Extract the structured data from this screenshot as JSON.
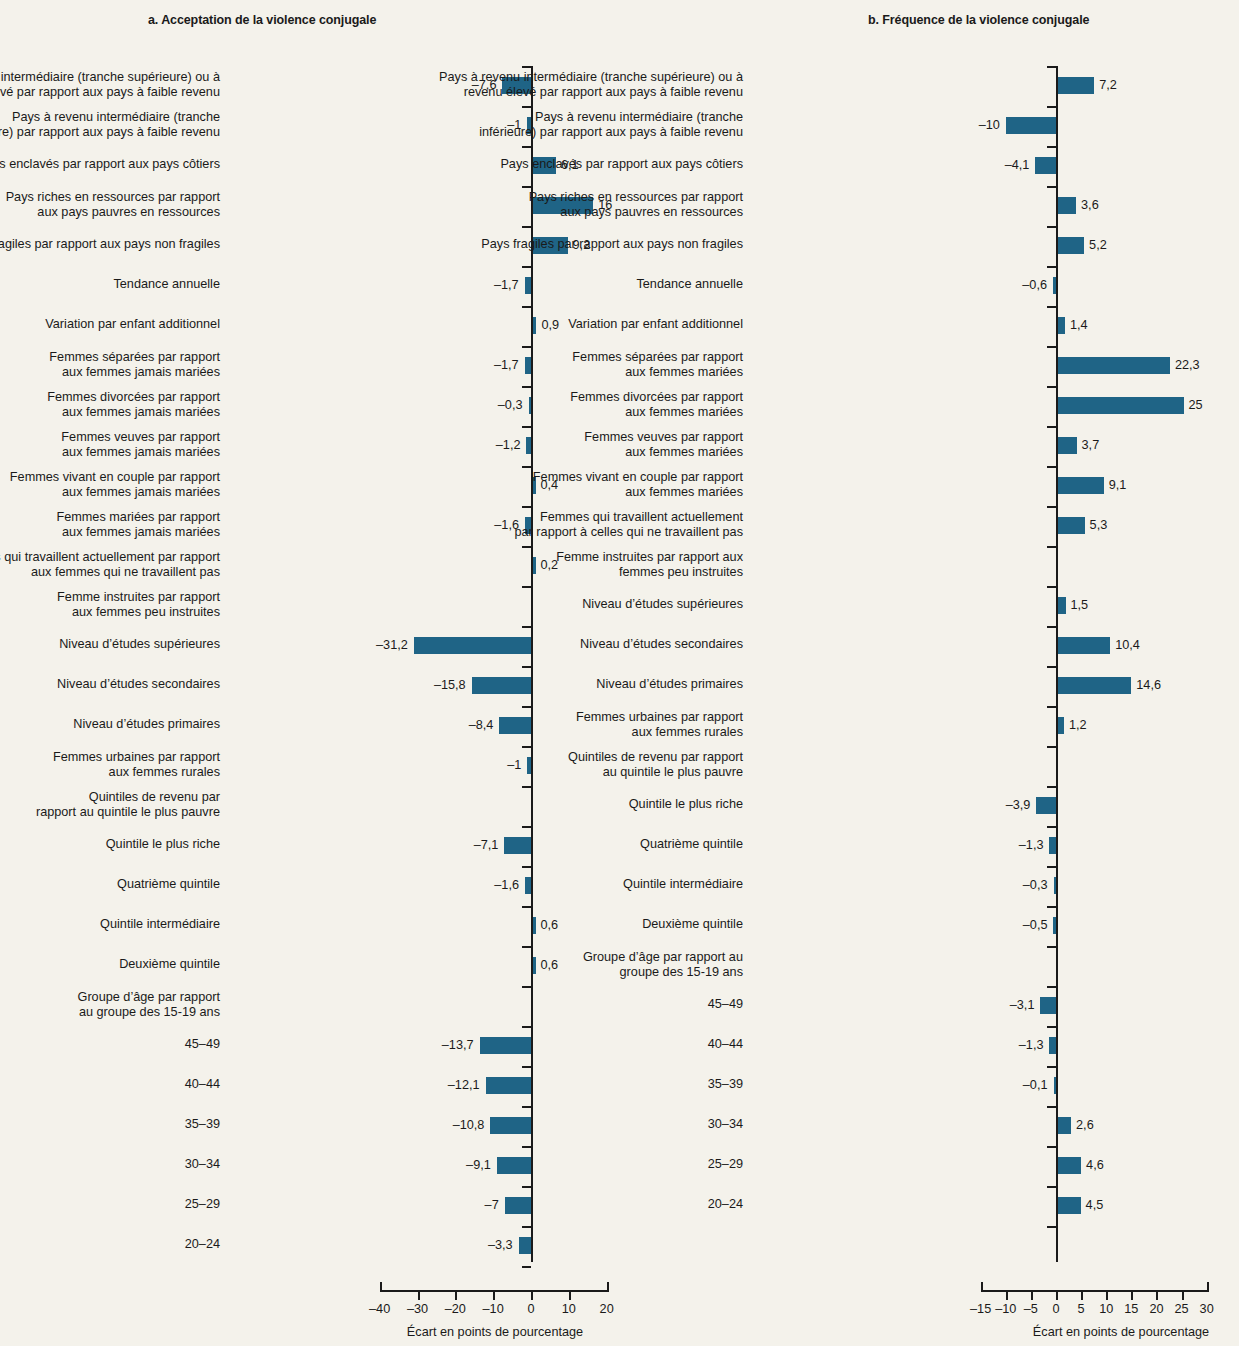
{
  "figure": {
    "background_color": "#f4f2eb",
    "bar_color": "#1f6486",
    "text_color": "#1a1a1a"
  },
  "panel_a": {
    "title": "a. Acceptation de la violence conjugale",
    "axis_caption": "Écart en points de pourcentage"
  },
  "panel_b": {
    "title": "b. Fréquence de la violence conjugale",
    "axis_caption": "Écart en points de pourcentage"
  },
  "chart_data": [
    {
      "type": "bar",
      "orientation": "horizontal",
      "title": "a. Acceptation de la violence conjugale",
      "xlabel": "Écart en points de pourcentage",
      "ylabel": "",
      "xlim": [
        -40,
        20
      ],
      "xticks": [
        -40,
        -30,
        -20,
        -10,
        0,
        10,
        20
      ],
      "xticklabels": [
        "–40",
        "–30",
        "–20",
        "–10",
        "0",
        "10",
        "20"
      ],
      "grid": false,
      "legend": null,
      "categories": [
        "Pays à revenu intermédiaire (tranche supérieure) ou à\nrevenu élevé par rapport aux pays à faible revenu",
        "Pays à revenu intermédiaire (tranche\ninférieure) par rapport aux pays à faible revenu",
        "Pays enclavés par rapport aux pays côtiers",
        "Pays riches en ressources par rapport\naux pays pauvres en ressources",
        "Pays fragiles par rapport aux pays non fragiles",
        "Tendance annuelle",
        "Variation par enfant additionnel",
        "Femmes séparées par rapport\naux femmes jamais mariées",
        "Femmes divorcées par rapport\naux femmes jamais mariées",
        "Femmes veuves par rapport\naux femmes jamais mariées",
        "Femmes vivant en couple par rapport\naux femmes jamais mariées",
        "Femmes mariées par rapport\naux femmes jamais mariées",
        "Femmes qui travaillent actuellement par rapport\naux femmes qui ne travaillent pas",
        "Femme instruites par rapport\naux femmes peu instruites",
        "Niveau d’études supérieures",
        "Niveau d’études secondaires",
        "Niveau d’études primaires",
        "Femmes urbaines par rapport\naux femmes rurales",
        "Quintiles de revenu par\nrapport au quintile le plus pauvre",
        "Quintile le plus riche",
        "Quatrième quintile",
        "Quintile intermédiaire",
        "Deuxième quintile",
        "Groupe d’âge par rapport\nau groupe des 15-19 ans",
        "45–49",
        "40–44",
        "35–39",
        "30–34",
        "25–29",
        "20–24"
      ],
      "values": [
        -7.6,
        -1,
        6.1,
        16,
        9.2,
        -1.7,
        0.9,
        -1.7,
        -0.3,
        -1.2,
        0.4,
        -1.6,
        0.2,
        null,
        -31.2,
        -15.8,
        -8.4,
        -1,
        null,
        -7.1,
        -1.6,
        0.6,
        0.6,
        null,
        -13.7,
        -12.1,
        -10.8,
        -9.1,
        -7,
        -3.3
      ],
      "value_labels": [
        "–7,6",
        "–1",
        "6,1",
        "16",
        "9,2",
        "–1,7",
        "0,9",
        "–1,7",
        "–0,3",
        "–1,2",
        "0,4",
        "–1,6",
        "0,2",
        "",
        "–31,2",
        "–15,8",
        "–8,4",
        "–1",
        "",
        "–7,1",
        "–1,6",
        "0,6",
        "0,6",
        "",
        "–13,7",
        "–12,1",
        "–10,8",
        "–9,1",
        "–7",
        "–3,3"
      ]
    },
    {
      "type": "bar",
      "orientation": "horizontal",
      "title": "b. Fréquence de la violence conjugale",
      "xlabel": "Écart en points de pourcentage",
      "ylabel": "",
      "xlim": [
        -15,
        30
      ],
      "xticks": [
        -15,
        -10,
        -5,
        0,
        5,
        10,
        15,
        20,
        25,
        30
      ],
      "xticklabels": [
        "–15",
        "–10",
        "–5",
        "0",
        "5",
        "10",
        "15",
        "20",
        "25",
        "30"
      ],
      "grid": false,
      "legend": null,
      "categories": [
        "Pays à revenu intermédiaire (tranche supérieure) ou à\nrevenu élevé par rapport aux pays à faible revenu",
        "Pays à revenu intermédiaire (tranche\ninférieure) par rapport aux pays à faible revenu",
        "Pays enclavés par rapport aux pays côtiers",
        "Pays riches en ressources par rapport\naux pays pauvres en ressources",
        "Pays fragiles par rapport aux pays non fragiles",
        "Tendance annuelle",
        "Variation par enfant additionnel",
        "Femmes séparées par rapport\naux femmes  mariées",
        "Femmes divorcées par rapport\naux femmes mariées",
        "Femmes veuves par rapport\naux femmes  mariées",
        "Femmes vivant en couple par rapport\naux femmes mariées",
        "Femmes qui travaillent actuellement\npar rapport à celles qui ne travaillent pas",
        "Femme instruites par rapport aux\nfemmes peu instruites",
        "Niveau d’études supérieures",
        "Niveau d’études secondaires",
        "Niveau d’études primaires",
        "Femmes urbaines par rapport\naux femmes rurales",
        "Quintiles de revenu par rapport\nau quintile le plus pauvre",
        "Quintile le plus riche",
        "Quatrième quintile",
        "Quintile intermédiaire",
        "Deuxième quintile",
        "Groupe d’âge par rapport au\ngroupe des 15-19 ans",
        "45–49",
        "40–44",
        "35–39",
        "30–34",
        "25–29",
        "20–24"
      ],
      "values": [
        7.2,
        -10,
        -4.1,
        3.6,
        5.2,
        -0.6,
        1.4,
        22.3,
        25,
        3.7,
        9.1,
        5.3,
        null,
        1.5,
        10.4,
        14.6,
        1.2,
        null,
        -3.9,
        -1.3,
        -0.3,
        -0.5,
        null,
        -3.1,
        -1.3,
        -0.1,
        2.6,
        4.6,
        4.5
      ],
      "value_labels": [
        "7,2",
        "–10",
        "–4,1",
        "3,6",
        "5,2",
        "–0,6",
        "1,4",
        "22,3",
        "25",
        "3,7",
        "9,1",
        "5,3",
        "",
        "1,5",
        "10,4",
        "14,6",
        "1,2",
        "",
        "–3,9",
        "–1,3",
        "–0,3",
        "–0,5",
        "",
        "–3,1",
        "–1,3",
        "–0,1",
        "2,6",
        "4,6",
        "4,5"
      ]
    }
  ]
}
